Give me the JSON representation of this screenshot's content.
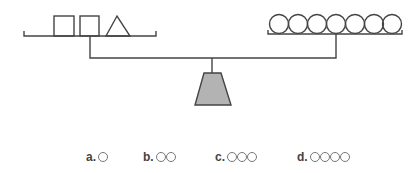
{
  "figure": {
    "left_pan": {
      "items": [
        "square",
        "square",
        "triangle"
      ]
    },
    "right_pan": {
      "items": [
        "circle",
        "circle",
        "circle",
        "circle",
        "circle",
        "circle",
        "circle"
      ],
      "count": 7
    },
    "fulcrum": {
      "fill": "#b3b3b3",
      "stroke": "#444444"
    },
    "line_color": "#444444"
  },
  "options": [
    {
      "label": "a.",
      "circles": 1
    },
    {
      "label": "b.",
      "circles": 2
    },
    {
      "label": "c.",
      "circles": 3
    },
    {
      "label": "d.",
      "circles": 4
    }
  ]
}
